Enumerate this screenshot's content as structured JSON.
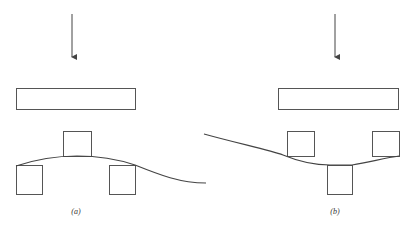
{
  "figure": {
    "panels": [
      {
        "id": "a",
        "label": "(a)",
        "arrow": {
          "x": 72,
          "y1": 14,
          "y2": 62
        },
        "beam": {
          "x": 16,
          "y": 88,
          "w": 119,
          "h": 21
        },
        "blocks": [
          {
            "name": "top-center-block",
            "x": 63,
            "y": 131,
            "w": 28,
            "h": 25
          },
          {
            "name": "bottom-left-block",
            "x": 16,
            "y": 165,
            "w": 26,
            "h": 29
          },
          {
            "name": "bottom-right-block",
            "x": 109,
            "y": 165,
            "w": 26,
            "h": 29
          }
        ],
        "curve": "M16,166 C40,158 60,156 77,156 C100,156 120,160 135,165 C160,175 180,183 206,183"
      },
      {
        "id": "b",
        "label": "(b)",
        "arrow": {
          "x": 335,
          "y1": 14,
          "y2": 62
        },
        "beam": {
          "x": 278,
          "y": 88,
          "w": 120,
          "h": 21
        },
        "blocks": [
          {
            "name": "top-left-block",
            "x": 287,
            "y": 131,
            "w": 27,
            "h": 25
          },
          {
            "name": "top-right-block",
            "x": 372,
            "y": 131,
            "w": 27,
            "h": 25
          },
          {
            "name": "bottom-center-block",
            "x": 327,
            "y": 165,
            "w": 25,
            "h": 29
          }
        ],
        "curve": "M204,134 C240,144 270,150 283,155 C300,162 315,165 330,165 L352,165 C370,162 385,158 399,156"
      }
    ],
    "stroke_color": "#555555"
  }
}
